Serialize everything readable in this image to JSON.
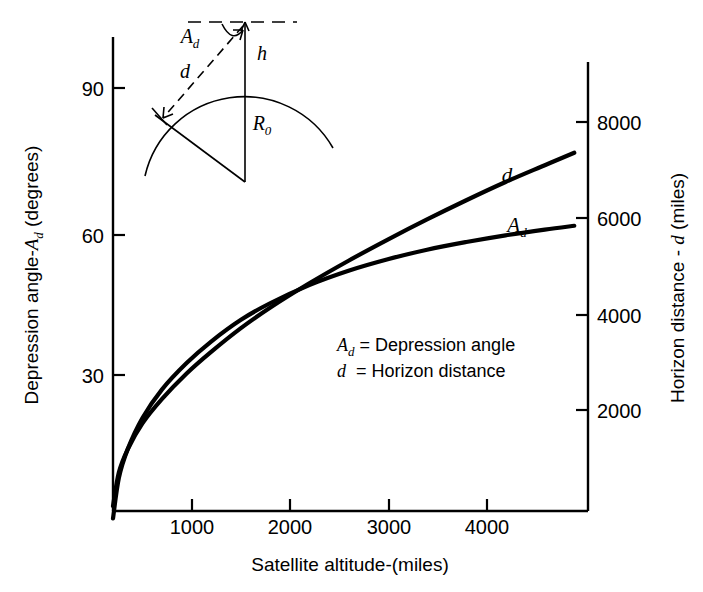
{
  "chart_data": {
    "type": "line",
    "title": "",
    "xlabel": "Satellite altitude-(miles)",
    "ylabel_left": "Depression angle-A_d (degrees)",
    "ylabel_right": "Horizon distance - d (miles)",
    "xlim": [
      0,
      4840
    ],
    "ylim_left": [
      0,
      105
    ],
    "ylim_right": [
      0,
      9800
    ],
    "grid": false,
    "legend_position": "inside-center",
    "x_ticks": [
      1000,
      2000,
      3000,
      4000
    ],
    "x_tick_labels": [
      "1000",
      "2000",
      "3000",
      "4000"
    ],
    "y_ticks_left": [
      30,
      60,
      90
    ],
    "y_tick_labels_left": [
      "30",
      "60",
      "90"
    ],
    "y_ticks_right": [
      2000,
      4000,
      6000,
      8000
    ],
    "y_tick_labels_right": [
      "2000",
      "4000",
      "6000",
      "8000"
    ],
    "series": [
      {
        "name": "A_d",
        "label": "A_d",
        "axis": "left",
        "units": "degrees",
        "x": [
          0,
          60,
          150,
          300,
          500,
          750,
          1000,
          1300,
          1600,
          2000,
          2400,
          2800,
          3200,
          3600,
          4000,
          4400,
          4700
        ],
        "values": [
          0,
          8.5,
          14.5,
          21.0,
          27.0,
          32.5,
          37.0,
          41.5,
          45.0,
          48.8,
          51.8,
          54.2,
          56.2,
          57.8,
          59.2,
          60.4,
          61.2
        ]
      },
      {
        "name": "d",
        "label": "d",
        "axis": "right",
        "units": "miles",
        "x": [
          0,
          60,
          150,
          300,
          500,
          750,
          1000,
          1300,
          1600,
          2000,
          2400,
          2800,
          3200,
          3600,
          4000,
          4400,
          4700
        ],
        "values": [
          0,
          700,
          1180,
          1720,
          2230,
          2760,
          3210,
          3700,
          4130,
          4640,
          5110,
          5550,
          5970,
          6370,
          6750,
          7100,
          7360
        ]
      }
    ],
    "annotations": [
      {
        "name": "legend-line-1",
        "text": "A_d = Depression angle"
      },
      {
        "name": "legend-line-2",
        "text": "d  = Horizon distance"
      }
    ]
  },
  "axes": {
    "x_title": "Satellite altitude-(miles)",
    "x_ticks": [
      "1000",
      "2000",
      "3000",
      "4000"
    ],
    "left_title_parts": {
      "prefix": "Depression angle-",
      "symbol": "A",
      "subscript": "d",
      "suffix": " (degrees)"
    },
    "left_ticks": [
      "30",
      "60",
      "90"
    ],
    "right_title_parts": {
      "prefix": "Horizon distance - ",
      "symbol": "d",
      "suffix": " (miles)"
    },
    "right_ticks": [
      "2000",
      "4000",
      "6000",
      "8000"
    ]
  },
  "legend": {
    "row1": {
      "symbol": "A",
      "subscript": "d",
      "equals": "=",
      "text": "Depression angle"
    },
    "row2": {
      "symbol": "d",
      "equals": "=",
      "text": "Horizon distance"
    }
  },
  "curve_labels": {
    "upper": {
      "symbol": "d"
    },
    "lower": {
      "symbol": "A",
      "subscript": "d"
    }
  },
  "diagram": {
    "angle_symbol": "A",
    "angle_subscript": "d",
    "distance_symbol": "d",
    "height_symbol": "h",
    "radius_symbol": "R",
    "radius_subscript": "0"
  }
}
